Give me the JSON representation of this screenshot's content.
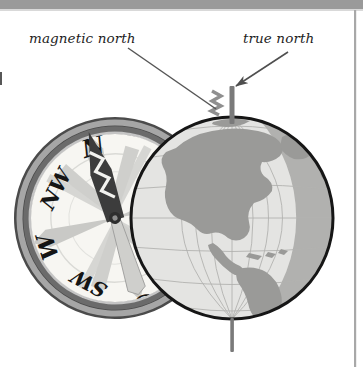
{
  "figure": {
    "title_visible": false,
    "background_color": "#ffffff",
    "top_band_color": "#9a9a9a",
    "right_rule_color": "#a8a8a8"
  },
  "labels": {
    "magnetic_north": "magnetic north",
    "true_north": "true north"
  },
  "annotations": {
    "magnetic_pointer": {
      "name": "magnetic-north-leader-line",
      "from": [
        128,
        48
      ],
      "to": [
        216,
        109
      ],
      "has_arrowhead": false,
      "color": "#5a5a5a"
    },
    "true_pointer": {
      "name": "true-north-arrow",
      "from": [
        288,
        52
      ],
      "to": [
        232,
        89
      ],
      "has_arrowhead": true,
      "color": "#5a5a5a"
    }
  },
  "compass": {
    "center": [
      115,
      218
    ],
    "outer_radius": 101,
    "rotation_deg": -17,
    "ring_outer_color": "#4a4a4a",
    "ring_mid_color": "#9d9d9d",
    "ring_inner_color": "#6e6e6e",
    "face_color": "#f7f6f2",
    "star_color": "#c9c9c6",
    "needle_color": "#3a3a3a",
    "cardinal_points": [
      "N",
      "NW",
      "W",
      "SW",
      "S"
    ],
    "visible_cardinals": [
      {
        "label": "N",
        "angle_deg": 0
      },
      {
        "label": "NW",
        "angle_deg": -45
      },
      {
        "label": "W",
        "angle_deg": -90
      },
      {
        "label": "SW",
        "angle_deg": -135
      },
      {
        "label": "S",
        "angle_deg": 180
      }
    ],
    "needle_pattern": "zigzag"
  },
  "globe": {
    "center": [
      232,
      218
    ],
    "radius": 101,
    "ocean_color": "#e3e3e1",
    "land_color": "#9a9a98",
    "outline_color": "#1a1a1a",
    "graticule_color": "#b0b0ae",
    "shading_color": "#a5a5a3",
    "landmasses": [
      "North America",
      "South America",
      "Greenland",
      "Caribbean"
    ],
    "graticule": {
      "meridians": 8,
      "parallels": 7
    }
  },
  "axis": {
    "name": "rotation-axis",
    "color": "#7a7a7a",
    "top": [
      232,
      86
    ],
    "bottom": [
      232,
      352
    ],
    "width": 5
  },
  "magnetic_pole_marker": {
    "name": "lightning-zigzag",
    "color": "#8d8d8d",
    "position": [
      216,
      100
    ]
  }
}
